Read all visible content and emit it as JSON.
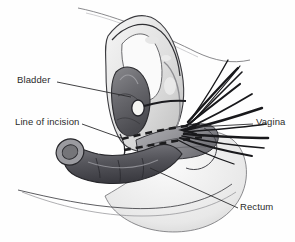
{
  "figure": {
    "type": "medical-anatomical-line-illustration",
    "background_color": "#fefefe",
    "ink_color": "#2b2b2b",
    "width": 295,
    "height": 242
  },
  "labels": [
    {
      "id": "bladder",
      "text": "Bladder",
      "text_x": 17,
      "text_y": 75,
      "leader": {
        "x1": 57,
        "y1": 82,
        "x2": 131,
        "y2": 97
      },
      "anchor": "left"
    },
    {
      "id": "incision",
      "text": "Line of incision",
      "text_x": 15,
      "text_y": 117,
      "leader": {
        "x1": 82,
        "y1": 124,
        "x2": 121,
        "y2": 138
      },
      "anchor": "left"
    },
    {
      "id": "vagina",
      "text": "Vagina",
      "text_x": 256,
      "text_y": 117,
      "leader": {
        "x1": 253,
        "y1": 124,
        "x2": 196,
        "y2": 127
      },
      "anchor": "right"
    },
    {
      "id": "rectum",
      "text": "Rectum",
      "text_x": 240,
      "text_y": 202,
      "leader": {
        "x1": 238,
        "y1": 208,
        "x2": 150,
        "y2": 168
      },
      "anchor": "right"
    }
  ],
  "anatomy": {
    "bladder": {
      "name": "Bladder",
      "fill": "#6f6f73",
      "stroke": "#2f2f33",
      "note": "dark shaded organ in mid-upper pelvis"
    },
    "pubic_bone": {
      "name": "Pubic bone / pelvic wall",
      "fill": "#e3e3e3",
      "stroke": "#3a3a3a"
    },
    "rectum": {
      "name": "Rectum",
      "fill": "#5e5e63",
      "stroke": "#2b2b2e",
      "note": "dark curved tube lower left with circular cut end"
    },
    "vagina": {
      "name": "Vagina",
      "fill": "#9a9a9e",
      "stroke": "#3a3a3d"
    },
    "catheter_balloon": {
      "name": "catheter-balloon-marker",
      "fill": "#f4f4f2",
      "stroke": "#2b2b2e",
      "cx": 138,
      "cy": 108,
      "rx": 6,
      "ry": 8
    },
    "body_outline": {
      "name": "Perineal / buttock outline",
      "fill": "#f2f2f2",
      "stroke": "#555558"
    }
  },
  "incision_line": {
    "name": "Line of incision",
    "style": "dashed",
    "color": "#1c1c1e",
    "dash_pattern": "7 5",
    "stroke_width": 2.6
  },
  "retractors": {
    "name": "surgical-retractor-instruments",
    "color": "#1a1a1c",
    "count": 12,
    "note": "thin dark instrument shafts radiating right and upper-right from the operative field"
  }
}
